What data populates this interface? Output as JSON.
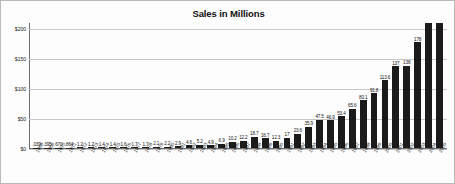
{
  "chart_data": {
    "type": "bar",
    "title": "Sales in Millions",
    "xlabel": "",
    "ylabel": "",
    "ylim": [
      0,
      210
    ],
    "yticks": [
      0,
      50,
      100,
      150,
      200
    ],
    "ytick_labels": [
      "$0",
      "$50",
      "$100",
      "$150",
      "$200"
    ],
    "grid": true,
    "legend": "none",
    "bar_color": "#1b1b1b",
    "categories": [
      "1968",
      "1969",
      "1970",
      "1971",
      "1972",
      "1973",
      "1974",
      "1975",
      "1976",
      "1977",
      "1978",
      "1979",
      "1980",
      "1981",
      "1982",
      "1983",
      "1984",
      "1985",
      "1986",
      "1987",
      "1988",
      "1989",
      "1990",
      "1991",
      "1992",
      "1993",
      "1994",
      "1995",
      "1996",
      "1997",
      "1998",
      "1999",
      "2000",
      "2001",
      "2002",
      "2003",
      "2004",
      "2005"
    ],
    "values": [
      0.039,
      0.395,
      0.67,
      0.864,
      1.2,
      1.2,
      1.4,
      1.4,
      1.6,
      1.7,
      1.7,
      2.1,
      2.2,
      2.9,
      4.6,
      5.2,
      4.9,
      6.9,
      10.2,
      12.2,
      18.7,
      16.7,
      12.3,
      17,
      23.6,
      35.9,
      47.5,
      46.9,
      53.4,
      65.6,
      80.1,
      91.8,
      113.6,
      137,
      138,
      178,
      250,
      250
    ],
    "data_labels": [
      ".039",
      ".395",
      ".670",
      ".864",
      "1.2",
      "1.2",
      "1.4",
      "1.4",
      "1.6",
      "1.7",
      "1.7",
      "2.1",
      "2.2",
      "2.9",
      "4.6",
      "5.2",
      "4.9",
      "6.9",
      "10.2",
      "12.2",
      "18.7",
      "16.7",
      "12.3",
      "17",
      "23.6",
      "35.9",
      "47.5",
      "46.9",
      "53.4",
      "65.6",
      "80.1",
      "91.8",
      "113.6",
      "137",
      "138",
      "178",
      "250",
      "250"
    ]
  }
}
